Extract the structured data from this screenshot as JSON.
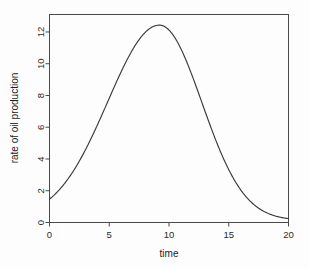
{
  "chart_data": {
    "type": "line",
    "title": "",
    "xlabel": "time",
    "ylabel": "rate of oil production",
    "xlim": [
      0,
      20
    ],
    "ylim": [
      0,
      13.1
    ],
    "grid": false,
    "legend": null,
    "xticks": [
      "0",
      "5",
      "10",
      "15",
      "20"
    ],
    "xtick_values": [
      0,
      5,
      10,
      15,
      20
    ],
    "yticks": [
      "0",
      "2",
      "4",
      "6",
      "8",
      "10",
      "12"
    ],
    "ytick_values": [
      0,
      2,
      4,
      6,
      8,
      10,
      12
    ],
    "series": [
      {
        "name": "rate of oil production",
        "color": "#3a3a3a",
        "x": [
          0,
          0.5,
          1,
          1.5,
          2,
          2.5,
          3,
          3.5,
          4,
          4.5,
          5,
          5.5,
          6,
          6.5,
          7,
          7.5,
          8,
          8.5,
          9,
          9.2,
          9.5,
          10,
          10.5,
          11,
          11.5,
          12,
          12.5,
          13,
          13.5,
          14,
          14.5,
          15,
          15.5,
          16,
          16.5,
          17,
          17.5,
          18,
          18.5,
          19,
          19.5,
          20
        ],
        "values": [
          0.52,
          0.62,
          0.75,
          0.9,
          1.08,
          1.3,
          1.56,
          1.87,
          2.24,
          2.67,
          3.17,
          3.75,
          4.41,
          5.15,
          5.96,
          6.83,
          7.72,
          8.6,
          9.41,
          9.7,
          10.12,
          10.7,
          11.15,
          11.46,
          11.62,
          11.62,
          11.46,
          11.15,
          10.7,
          10.12,
          9.44,
          8.68,
          7.87,
          7.04,
          6.22,
          5.43,
          4.69,
          4.01,
          3.4,
          2.86,
          2.39,
          1.98
        ]
      }
    ],
    "peak": {
      "x": 9.2,
      "y": 12.43
    },
    "start_value": 0.5,
    "end_value": 0.25
  },
  "axes": {
    "x_axis_title": "time",
    "y_axis_title": "rate of oil production"
  }
}
